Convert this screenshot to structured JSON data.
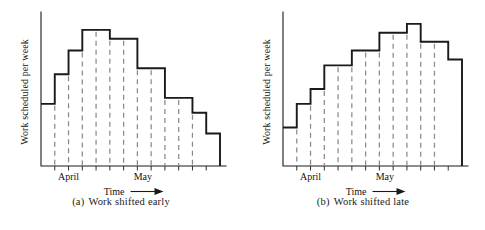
{
  "figure": {
    "panels": [
      {
        "id": "panel-a",
        "caption_index": "(a)",
        "caption_text": "Work shifted early",
        "ylabel": "Work scheduled per week",
        "xlabel": "Time",
        "xlabel_arrow": "⟶",
        "month_labels": [
          "April",
          "May"
        ]
      },
      {
        "id": "panel-b",
        "caption_index": "(b)",
        "caption_text": "Work shifted late",
        "ylabel": "Work scheduled per week",
        "xlabel": "Time",
        "xlabel_arrow": "⟶",
        "month_labels": [
          "April",
          "May"
        ]
      }
    ]
  },
  "colors": {
    "ink": "#1a1a1a",
    "dash": "#8a8a8a",
    "background": "#ffffff"
  },
  "chart_data": [
    {
      "type": "bar",
      "id": "work-shifted-early",
      "title": "(a) Work shifted early",
      "xlabel": "Time",
      "ylabel": "Work scheduled per week",
      "grid": false,
      "legend": "none",
      "categories": [
        "w1",
        "w2",
        "w3",
        "w4",
        "w5",
        "w6",
        "w7",
        "w8",
        "w9",
        "w10",
        "w11",
        "w12",
        "w13"
      ],
      "values": [
        42,
        62,
        78,
        92,
        92,
        86,
        86,
        66,
        66,
        46,
        46,
        36,
        22
      ],
      "ylim": [
        0,
        100
      ],
      "xlim": [
        0,
        13
      ],
      "month_ticks": [
        {
          "label": "April",
          "position": 2.0
        },
        {
          "label": "May",
          "position": 7.4
        }
      ],
      "dashed_dividers": [
        1,
        2,
        3,
        4,
        5,
        6,
        7,
        8,
        9,
        10,
        11
      ],
      "axis_ticks": 13,
      "note": "step profile rises quickly to an early peak then declines in stages"
    },
    {
      "type": "bar",
      "id": "work-shifted-late",
      "title": "(b) Work shifted late",
      "xlabel": "Time",
      "ylabel": "Work scheduled per week",
      "grid": false,
      "legend": "none",
      "categories": [
        "w1",
        "w2",
        "w3",
        "w4",
        "w5",
        "w6",
        "w7",
        "w8",
        "w9",
        "w10",
        "w11",
        "w12",
        "w13"
      ],
      "values": [
        26,
        42,
        52,
        68,
        68,
        78,
        78,
        90,
        90,
        96,
        84,
        84,
        72
      ],
      "ylim": [
        0,
        100
      ],
      "xlim": [
        0,
        13
      ],
      "month_ticks": [
        {
          "label": "April",
          "position": 2.0
        },
        {
          "label": "May",
          "position": 7.4
        }
      ],
      "dashed_dividers": [
        1,
        2,
        3,
        4,
        5,
        6,
        7,
        8,
        9,
        10,
        11
      ],
      "axis_ticks": 13,
      "note": "step profile rises gradually to a late peak then drops near the end"
    }
  ]
}
